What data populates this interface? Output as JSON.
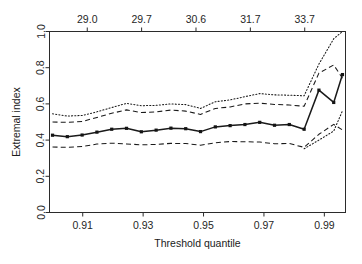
{
  "chart_data": {
    "type": "line",
    "title": "",
    "xlabel": "Threshold quantile",
    "ylabel": "Extremal index",
    "xlim": [
      0.899,
      0.997
    ],
    "ylim": [
      0.0,
      1.0
    ],
    "grid": false,
    "legend": "none",
    "x_ticks": [
      0.91,
      0.93,
      0.95,
      0.97,
      0.99
    ],
    "x_tick_labels": [
      "0.91",
      "0.93",
      "0.95",
      "0.97",
      "0.99"
    ],
    "y_ticks": [
      0.0,
      0.2,
      0.4,
      0.6,
      0.8,
      1.0
    ],
    "y_tick_labels": [
      "0.0",
      "0.2",
      "0.4",
      "0.6",
      "0.8",
      "1.0"
    ],
    "secondary_axis": {
      "position": "top",
      "label": "",
      "ticks": [
        0.9115,
        0.9295,
        0.9475,
        0.9655,
        0.9835
      ],
      "tick_labels": [
        "29.0",
        "29.7",
        "30.6",
        "31.7",
        "33.7"
      ]
    },
    "x": [
      0.9,
      0.9049,
      0.9098,
      0.9147,
      0.9196,
      0.9245,
      0.9294,
      0.9343,
      0.9392,
      0.9441,
      0.949,
      0.9539,
      0.9588,
      0.9637,
      0.9686,
      0.9735,
      0.9784,
      0.9833,
      0.9882,
      0.9931,
      0.996
    ],
    "series": [
      {
        "name": "upper-dotted",
        "style": "dotted",
        "markers": false,
        "values": [
          0.545,
          0.533,
          0.536,
          0.556,
          0.58,
          0.603,
          0.59,
          0.592,
          0.6,
          0.596,
          0.575,
          0.612,
          0.622,
          0.64,
          0.657,
          0.65,
          0.648,
          0.645,
          0.82,
          0.96,
          1.0
        ]
      },
      {
        "name": "upper-dashed",
        "style": "dashed",
        "markers": false,
        "values": [
          0.5,
          0.498,
          0.503,
          0.525,
          0.548,
          0.567,
          0.552,
          0.556,
          0.566,
          0.56,
          0.542,
          0.575,
          0.583,
          0.6,
          0.604,
          0.597,
          0.594,
          0.587,
          0.77,
          0.815,
          0.742
        ]
      },
      {
        "name": "estimate",
        "style": "solid",
        "markers": true,
        "values": [
          0.427,
          0.419,
          0.428,
          0.444,
          0.46,
          0.465,
          0.446,
          0.455,
          0.466,
          0.463,
          0.447,
          0.473,
          0.48,
          0.486,
          0.498,
          0.482,
          0.486,
          0.46,
          0.676,
          0.608,
          0.762
        ]
      },
      {
        "name": "lower-dashed",
        "style": "dashed",
        "markers": false,
        "values": [
          0.362,
          0.36,
          0.365,
          0.378,
          0.383,
          0.379,
          0.374,
          0.376,
          0.382,
          0.381,
          0.372,
          0.385,
          0.392,
          0.391,
          0.389,
          0.38,
          0.381,
          0.36,
          0.432,
          0.487,
          0.456
        ]
      },
      {
        "name": "lower-dotted",
        "style": "dotted",
        "markers": false,
        "values": [
          null,
          null,
          null,
          null,
          null,
          null,
          null,
          null,
          null,
          null,
          null,
          null,
          null,
          null,
          null,
          null,
          null,
          0.352,
          0.4,
          0.45,
          0.562
        ]
      }
    ]
  },
  "figure": {
    "ylabel": "Extremal index",
    "xlabel": "Threshold quantile"
  }
}
